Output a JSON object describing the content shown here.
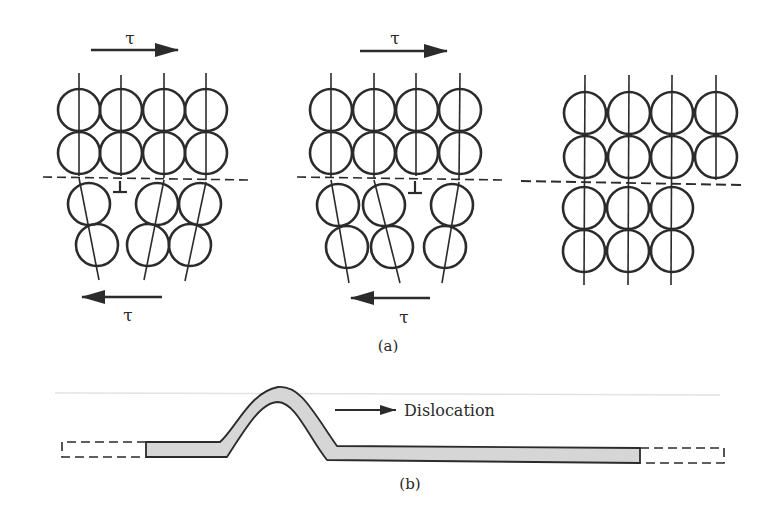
{
  "figure": {
    "panel_a": {
      "label": "(a)",
      "shear_symbol": "τ",
      "stages": [
        {
          "name": "stage-1",
          "top_arrow_label": "τ",
          "bottom_arrow_label": "τ",
          "dislocation_symbol": "⊥"
        },
        {
          "name": "stage-2",
          "top_arrow_label": "τ",
          "bottom_arrow_label": "τ",
          "dislocation_symbol": "⊥"
        },
        {
          "name": "stage-3-slipped"
        }
      ]
    },
    "panel_b": {
      "label": "(b)",
      "arrow_label": "Dislocation"
    },
    "colors": {
      "line": "#2b2b2b",
      "fill": "#d6d6d6",
      "background": "#ffffff"
    }
  }
}
